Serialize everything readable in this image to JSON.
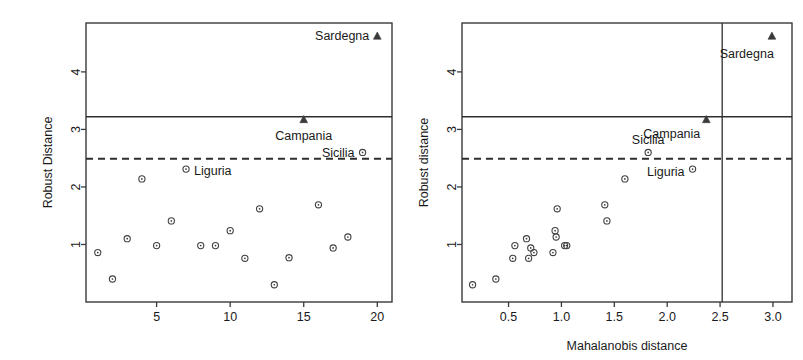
{
  "figure": {
    "title": "",
    "panels": 2
  },
  "chart_data": [
    {
      "type": "scatter",
      "panel": "left",
      "title": "",
      "xlabel": "",
      "ylabel": "Robust Distance",
      "xlim": [
        0.2,
        21.0
      ],
      "ylim": [
        0.0,
        4.85
      ],
      "xticks": [
        5,
        10,
        15,
        20
      ],
      "xtick_labels": [
        "5",
        "10",
        "15",
        "20"
      ],
      "yticks": [
        1,
        2,
        3,
        4
      ],
      "ytick_labels": [
        "1",
        "2",
        "3",
        "4"
      ],
      "grid": false,
      "legend": null,
      "hlines": [
        {
          "y": 3.22,
          "style": "solid",
          "label": ""
        },
        {
          "y": 2.49,
          "style": "dashed",
          "label": ""
        }
      ],
      "x": [
        1,
        2,
        3,
        4,
        5,
        6,
        7,
        8,
        9,
        10,
        11,
        12,
        13,
        14,
        15,
        16,
        17,
        18,
        19,
        20
      ],
      "y": [
        0.86,
        0.4,
        1.1,
        2.14,
        0.98,
        1.41,
        2.31,
        0.98,
        0.98,
        1.24,
        0.76,
        1.62,
        0.3,
        0.77,
        3.17,
        1.69,
        0.94,
        1.13,
        2.6,
        4.62
      ],
      "markers": [
        "circle",
        "circle",
        "circle",
        "circle",
        "circle",
        "circle",
        "circle",
        "circle",
        "circle",
        "circle",
        "circle",
        "circle",
        "circle",
        "circle",
        "triangle",
        "circle",
        "circle",
        "circle",
        "circle",
        "triangle"
      ],
      "annotations": [
        {
          "text": "Sardegna",
          "x": 20,
          "y": 4.62,
          "anchor": "end",
          "dx": -8,
          "dy": 0
        },
        {
          "text": "Campania",
          "x": 15,
          "y": 3.17,
          "anchor": "middle",
          "dx": 0,
          "dy": 16
        },
        {
          "text": "Sicilia",
          "x": 19,
          "y": 2.6,
          "anchor": "end",
          "dx": -8,
          "dy": 1
        },
        {
          "text": "Liguria",
          "x": 7,
          "y": 2.31,
          "anchor": "start",
          "dx": 8,
          "dy": 2
        }
      ]
    },
    {
      "type": "scatter",
      "panel": "right",
      "title": "",
      "xlabel": "Mahalanobis distance",
      "ylabel": "Robust distance",
      "xlim": [
        0.06,
        3.18
      ],
      "ylim": [
        0.0,
        4.85
      ],
      "xticks": [
        0.5,
        1.0,
        1.5,
        2.0,
        2.5,
        3.0
      ],
      "xtick_labels": [
        "0.5",
        "1.0",
        "1.5",
        "2.0",
        "2.5",
        "3.0"
      ],
      "yticks": [
        1,
        2,
        3,
        4
      ],
      "ytick_labels": [
        "1",
        "2",
        "3",
        "4"
      ],
      "grid": false,
      "legend": null,
      "hlines": [
        {
          "y": 3.22,
          "style": "solid",
          "label": ""
        },
        {
          "y": 2.49,
          "style": "dashed",
          "label": ""
        }
      ],
      "vlines": [
        {
          "x": 2.52,
          "style": "solid",
          "label": ""
        }
      ],
      "x": [
        0.16,
        0.38,
        0.54,
        0.56,
        0.67,
        0.69,
        0.71,
        0.74,
        0.92,
        0.94,
        0.95,
        0.96,
        1.03,
        1.05,
        1.41,
        1.43,
        1.6,
        1.82,
        2.24,
        2.37,
        2.99
      ],
      "y": [
        0.3,
        0.4,
        0.76,
        0.98,
        1.1,
        0.76,
        0.94,
        0.86,
        0.86,
        1.24,
        1.13,
        1.62,
        0.98,
        0.98,
        1.69,
        1.41,
        2.14,
        2.6,
        2.31,
        3.17,
        4.62
      ],
      "markers": [
        "circle",
        "circle",
        "circle",
        "circle",
        "circle",
        "circle",
        "circle",
        "circle",
        "circle",
        "circle",
        "circle",
        "circle",
        "circle",
        "circle",
        "circle",
        "circle",
        "circle",
        "circle",
        "circle",
        "triangle",
        "triangle"
      ],
      "annotations": [
        {
          "text": "Sardegna",
          "x": 2.99,
          "y": 4.62,
          "anchor": "end",
          "dx": 2,
          "dy": 18
        },
        {
          "text": "Campania",
          "x": 2.37,
          "y": 3.17,
          "anchor": "end",
          "dx": -6,
          "dy": 14
        },
        {
          "text": "Sicilia",
          "x": 1.82,
          "y": 2.6,
          "anchor": "middle",
          "dx": 0,
          "dy": -12
        },
        {
          "text": "Liguria",
          "x": 2.24,
          "y": 2.31,
          "anchor": "end",
          "dx": -8,
          "dy": 3
        }
      ]
    }
  ]
}
